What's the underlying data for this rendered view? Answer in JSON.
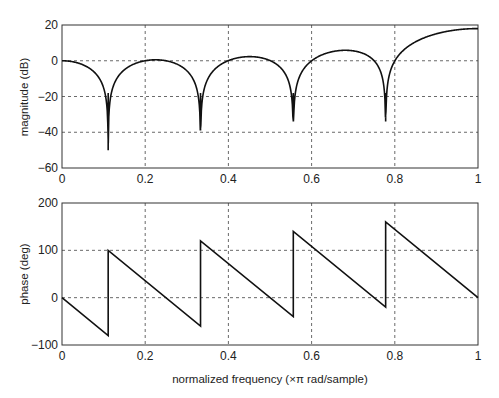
{
  "chart_data": [
    {
      "type": "line",
      "title": "",
      "xlabel": "",
      "ylabel": "magnitude (dB)",
      "xlim": [
        0,
        1
      ],
      "ylim": [
        -60,
        20
      ],
      "xticks": [
        "0",
        "0.2",
        "0.4",
        "0.6",
        "0.8",
        "1"
      ],
      "yticks": [
        "20",
        "0",
        "−20",
        "−40",
        "−60"
      ],
      "grid": true,
      "zeros": [
        0.111,
        0.333,
        0.556,
        0.778
      ],
      "dip_values": [
        -50,
        -39,
        -34,
        -34
      ],
      "series": [
        {
          "name": "magnitude",
          "x": [
            0,
            0.03,
            0.06,
            0.09,
            0.111,
            0.14,
            0.18,
            0.22,
            0.26,
            0.3,
            0.333,
            0.36,
            0.4,
            0.44,
            0.48,
            0.52,
            0.556,
            0.58,
            0.62,
            0.67,
            0.71,
            0.75,
            0.778,
            0.8,
            0.85,
            0.9,
            0.95,
            1.0
          ],
          "values": [
            0,
            -0.5,
            -5,
            -17,
            -50,
            -12,
            -1.5,
            1.2,
            0,
            -6,
            -39,
            -8,
            0.8,
            2.3,
            0.5,
            -8,
            -34,
            -6,
            3.5,
            5.5,
            4,
            -5,
            -34,
            -3,
            8,
            14,
            17,
            18
          ]
        }
      ]
    },
    {
      "type": "line",
      "title": "",
      "xlabel": "normalized frequency (×π rad/sample)",
      "ylabel": "phase (deg)",
      "xlim": [
        0,
        1
      ],
      "ylim": [
        -100,
        200
      ],
      "xticks": [
        "0",
        "0.2",
        "0.4",
        "0.6",
        "0.8",
        "1"
      ],
      "yticks": [
        "200",
        "100",
        "0",
        "−100"
      ],
      "grid": true,
      "series": [
        {
          "name": "phase",
          "x": [
            0,
            0.111,
            0.111,
            0.333,
            0.333,
            0.556,
            0.556,
            0.778,
            0.778,
            1.0
          ],
          "values": [
            0,
            -80,
            100,
            -60,
            120,
            -40,
            140,
            -20,
            160,
            0
          ]
        }
      ]
    }
  ],
  "labels": {
    "top_ylabel": "magnitude (dB)",
    "bottom_ylabel": "phase (deg)",
    "xlabel": "normalized frequency (×π rad/sample)",
    "xticks": [
      "0",
      "0.2",
      "0.4",
      "0.6",
      "0.8",
      "1"
    ],
    "top_yticks": [
      "20",
      "0",
      "−20",
      "−40",
      "−60"
    ],
    "bottom_yticks": [
      "200",
      "100",
      "0",
      "−100"
    ]
  }
}
